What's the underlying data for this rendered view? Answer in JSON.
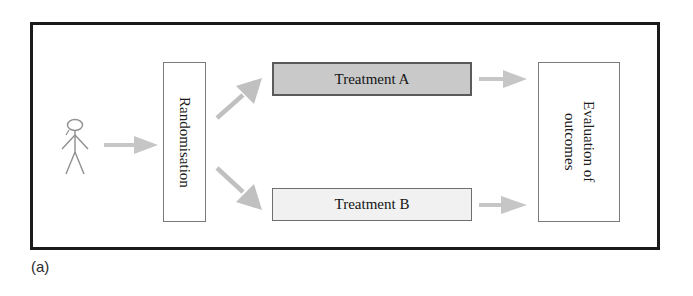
{
  "figure": {
    "caption": "(a)",
    "frame_color": "#1a1a1a"
  },
  "nodes": {
    "person": {
      "icon": "stick-figure-person-icon",
      "label": ""
    },
    "randomisation": {
      "label": "Randomisation",
      "fill": "#ffffff",
      "border": "#7a7a7a",
      "orientation": "vertical"
    },
    "treatment_a": {
      "label": "Treatment A",
      "fill": "#c9c9c9",
      "border": "#5a5a5a",
      "orientation": "horizontal"
    },
    "treatment_b": {
      "label": "Treatment B",
      "fill": "#f1f1f1",
      "border": "#6e6e6e",
      "orientation": "horizontal"
    },
    "evaluation": {
      "label_line1": "Evaluation of",
      "label_line2": "outcomes",
      "fill": "#ffffff",
      "border": "#7a7a7a",
      "orientation": "vertical"
    }
  },
  "arrows": {
    "color": "#bdbdbd",
    "items": [
      {
        "name": "person-to-randomisation",
        "direction": "right"
      },
      {
        "name": "randomisation-to-treatment-a",
        "direction": "up-right"
      },
      {
        "name": "randomisation-to-treatment-b",
        "direction": "down-right"
      },
      {
        "name": "treatment-a-to-evaluation",
        "direction": "right"
      },
      {
        "name": "treatment-b-to-evaluation",
        "direction": "right"
      }
    ]
  }
}
